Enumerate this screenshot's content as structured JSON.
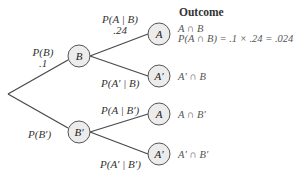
{
  "header": {
    "outcome_title": "Outcome"
  },
  "nodes": {
    "B": "B",
    "B_prime": "B′",
    "A_top": "A",
    "A_prime_top": "A′",
    "A_bottom": "A",
    "A_prime_bottom": "A′"
  },
  "branches": {
    "P_B": {
      "label": "P(B)",
      "value": ".1"
    },
    "P_B_prime": {
      "label": "P(B′)"
    },
    "P_A_given_B": {
      "label": "P(A | B)",
      "value": ".24"
    },
    "P_A_prime_given_B": {
      "label": "P(A′ | B)"
    },
    "P_A_given_B_prime": {
      "label": "P(A | B′)"
    },
    "P_A_prime_given_B_prime": {
      "label": "P(A′ | B′)"
    }
  },
  "outcomes": {
    "A_and_B": "A ∩ B",
    "A_and_B_calc": "P(A ∩ B) = .1 × .24 = .024",
    "A_prime_and_B": "A′ ∩ B",
    "A_and_B_prime": "A ∩ B′",
    "A_prime_and_B_prime": "A′ ∩ B′"
  },
  "colors": {
    "line": "#4a4a4a",
    "node_fill": "#ececec",
    "node_stroke": "#555555"
  }
}
